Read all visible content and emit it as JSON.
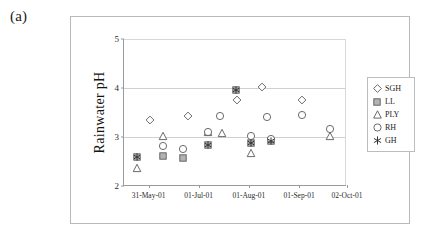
{
  "panel_label": "(a)",
  "chart_data": {
    "type": "scatter",
    "title": "",
    "xlabel": "",
    "ylabel": "Rainwater pH",
    "ylim": [
      2,
      5
    ],
    "yticks": [
      "2",
      "3",
      "4",
      "5"
    ],
    "ytick_values": [
      2,
      3,
      4,
      5
    ],
    "gridlines": [
      3,
      4
    ],
    "grid": true,
    "legend_position": "right",
    "xtick_labels": [
      "31-May-01",
      "01-Jul-01",
      "01-Aug-01",
      "01-Sep-01",
      "02-Oct-01"
    ],
    "xtick_fractions": [
      0.11,
      0.335,
      0.56,
      0.785,
      1.0
    ],
    "x_categories": [
      "31-May-01",
      "01-Jul-01",
      "01-Aug-01",
      "01-Sep-01",
      "02-Oct-01"
    ],
    "series": [
      {
        "name": "SGH",
        "marker": "diamond",
        "points": [
          {
            "xf": 0.115,
            "y": 3.35
          },
          {
            "xf": 0.285,
            "y": 3.43
          },
          {
            "xf": 0.505,
            "y": 3.76
          },
          {
            "xf": 0.62,
            "y": 4.02
          },
          {
            "xf": 0.8,
            "y": 3.76
          }
        ]
      },
      {
        "name": "LL",
        "marker": "square",
        "points": [
          {
            "xf": 0.06,
            "y": 2.6
          },
          {
            "xf": 0.175,
            "y": 2.62
          },
          {
            "xf": 0.265,
            "y": 2.57
          },
          {
            "xf": 0.375,
            "y": 2.84
          },
          {
            "xf": 0.5,
            "y": 3.96
          },
          {
            "xf": 0.57,
            "y": 2.88
          },
          {
            "xf": 0.66,
            "y": 2.92
          }
        ]
      },
      {
        "name": "PLY",
        "marker": "triangle",
        "points": [
          {
            "xf": 0.06,
            "y": 2.36
          },
          {
            "xf": 0.175,
            "y": 3.03
          },
          {
            "xf": 0.375,
            "y": 3.1
          },
          {
            "xf": 0.44,
            "y": 3.09
          },
          {
            "xf": 0.57,
            "y": 2.68
          },
          {
            "xf": 0.925,
            "y": 3.02
          }
        ]
      },
      {
        "name": "RH",
        "marker": "circle",
        "points": [
          {
            "xf": 0.175,
            "y": 2.81
          },
          {
            "xf": 0.265,
            "y": 2.76
          },
          {
            "xf": 0.375,
            "y": 3.11
          },
          {
            "xf": 0.43,
            "y": 3.42
          },
          {
            "xf": 0.57,
            "y": 3.03
          },
          {
            "xf": 0.66,
            "y": 2.95
          },
          {
            "xf": 0.64,
            "y": 3.41
          },
          {
            "xf": 0.8,
            "y": 3.44
          },
          {
            "xf": 0.925,
            "y": 3.17
          }
        ]
      },
      {
        "name": "GH",
        "marker": "asterisk",
        "points": [
          {
            "xf": 0.06,
            "y": 2.6
          },
          {
            "xf": 0.375,
            "y": 2.84
          },
          {
            "xf": 0.5,
            "y": 3.96
          },
          {
            "xf": 0.57,
            "y": 2.88
          },
          {
            "xf": 0.66,
            "y": 2.92
          }
        ]
      }
    ],
    "legend_entries": [
      {
        "label": "SGH",
        "marker": "diamond"
      },
      {
        "label": "LL",
        "marker": "square"
      },
      {
        "label": "PLY",
        "marker": "triangle"
      },
      {
        "label": "RH",
        "marker": "circle"
      },
      {
        "label": "GH",
        "marker": "asterisk"
      }
    ],
    "colors": {
      "marker_stroke": "#5a5a5a",
      "square_fill": "#b3b3b3",
      "axis": "#9a9a9a",
      "grid": "#d0d0d0",
      "frame": "#b9b9b9",
      "text": "#1a1a1a"
    }
  }
}
